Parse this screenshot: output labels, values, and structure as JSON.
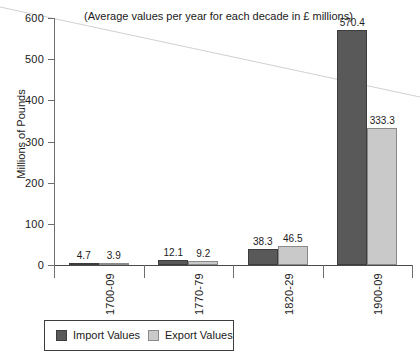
{
  "chart_data": {
    "type": "bar",
    "title": "(Average values per year for each decade in £ millions)",
    "xlabel": "",
    "ylabel": "Millions of Pounds",
    "categories": [
      "1700-09",
      "1770-79",
      "1820-29",
      "1900-09"
    ],
    "series": [
      {
        "name": "Import Values",
        "color": "#595959",
        "values": [
          4.7,
          12.1,
          38.3,
          570.4
        ]
      },
      {
        "name": "Export Values",
        "color": "#c9c9c9",
        "values": [
          3.9,
          9.2,
          46.5,
          333.3
        ]
      }
    ],
    "value_labels": {
      "import": [
        "4.7",
        "12.1",
        "38.3",
        "570.4"
      ],
      "export": [
        "3.9",
        "9.2",
        "46.5",
        "333.3"
      ]
    },
    "ylim": [
      0,
      600
    ],
    "yticks": [
      0,
      100,
      200,
      300,
      400,
      500,
      600
    ],
    "ytick_labels": [
      "0",
      "100",
      "200",
      "300",
      "400",
      "500",
      "600"
    ],
    "grid": false,
    "legend_position": "bottom-left"
  },
  "legend": {
    "items": [
      {
        "label": "Import Values",
        "swatch": "dark-grey-swatch"
      },
      {
        "label": "Export Values",
        "swatch": "light-grey-swatch"
      }
    ]
  }
}
